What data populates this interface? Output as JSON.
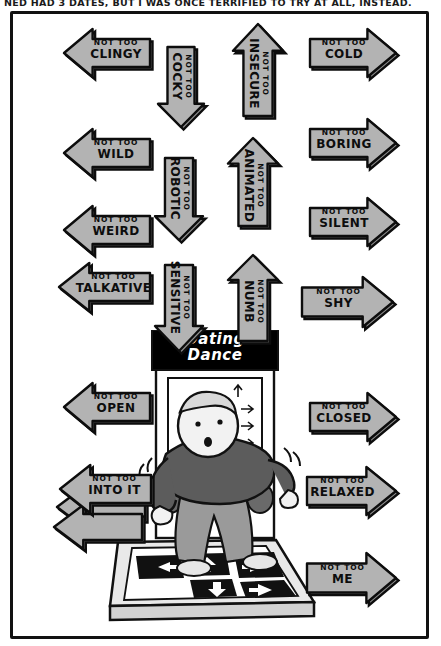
{
  "comic": {
    "caption": "NED HAD 3 DATES, BUT I WAS ONCE TERRIFIED TO TRY AT ALL, INSTEAD.",
    "panel_border_color": "#111111",
    "arrow_fill_color": "#b3b3b3",
    "arrow_shade_color": "#8f8f8f",
    "arrow_outline_color": "#0d0d0d",
    "background_color": "#ffffff"
  },
  "arcade": {
    "marquee_line1": "Dating",
    "marquee_line2": "Dance",
    "marquee_bg_color": "#000000",
    "marquee_text_color": "#ffffff",
    "screen_arrows": [
      "up-arrow",
      "right-arrow",
      "right-arrow",
      "right-arrow"
    ],
    "pad_arrows": [
      "left-arrow",
      "up-arrow",
      "down-arrow",
      "right-arrow"
    ],
    "dancer": {
      "sweater_color": "#5a5a5a",
      "jeans_color": "#8c8c8c",
      "skin_color": "#f2f2f2"
    }
  },
  "arrows": [
    {
      "id": "clingy",
      "prefix": "NOT TOO",
      "word": "CLINGY",
      "direction": "left",
      "x": 62,
      "y": 26,
      "w": 90,
      "h": 54
    },
    {
      "id": "cocky",
      "prefix": "NOT TOO",
      "word": "COCKY",
      "direction": "down",
      "x": 155,
      "y": 45,
      "w": 52,
      "h": 84
    },
    {
      "id": "insecure",
      "prefix": "NOT TOO",
      "word": "INSECURE",
      "direction": "up",
      "x": 230,
      "y": 22,
      "w": 56,
      "h": 96
    },
    {
      "id": "cold",
      "prefix": "NOT TOO",
      "word": "COLD",
      "direction": "right",
      "x": 308,
      "y": 26,
      "w": 90,
      "h": 54
    },
    {
      "id": "wild",
      "prefix": "NOT TOO",
      "word": "WILD",
      "direction": "left",
      "x": 62,
      "y": 126,
      "w": 90,
      "h": 54
    },
    {
      "id": "robotic",
      "prefix": "NOT TOO",
      "word": "ROBOTIC",
      "direction": "down",
      "x": 152,
      "y": 156,
      "w": 54,
      "h": 86
    },
    {
      "id": "animated",
      "prefix": "NOT TOO",
      "word": "ANIMATED",
      "direction": "up",
      "x": 225,
      "y": 136,
      "w": 56,
      "h": 92
    },
    {
      "id": "boring",
      "prefix": "NOT TOO",
      "word": "BORING",
      "direction": "right",
      "x": 308,
      "y": 116,
      "w": 90,
      "h": 54
    },
    {
      "id": "weird",
      "prefix": "NOT TOO",
      "word": "WEIRD",
      "direction": "left",
      "x": 62,
      "y": 203,
      "w": 90,
      "h": 54
    },
    {
      "id": "silent",
      "prefix": "NOT TOO",
      "word": "SILENT",
      "direction": "right",
      "x": 308,
      "y": 195,
      "w": 90,
      "h": 54
    },
    {
      "id": "talkative",
      "prefix": "NOT TOO",
      "word": "TALKATIVE",
      "direction": "left",
      "x": 57,
      "y": 260,
      "w": 95,
      "h": 54
    },
    {
      "id": "sensitive",
      "prefix": "NOT TOO",
      "word": "SENSITIVE",
      "direction": "down",
      "x": 152,
      "y": 263,
      "w": 54,
      "h": 90
    },
    {
      "id": "numb",
      "prefix": "NOT TOO",
      "word": "NUMB",
      "direction": "up",
      "x": 225,
      "y": 253,
      "w": 56,
      "h": 90
    },
    {
      "id": "shy",
      "prefix": "NOT TOO",
      "word": "SHY",
      "direction": "right",
      "x": 300,
      "y": 274,
      "w": 95,
      "h": 56
    },
    {
      "id": "open",
      "prefix": "NOT TOO",
      "word": "OPEN",
      "direction": "left",
      "x": 62,
      "y": 380,
      "w": 90,
      "h": 54
    },
    {
      "id": "closed",
      "prefix": "NOT TOO",
      "word": "CLOSED",
      "direction": "right",
      "x": 308,
      "y": 390,
      "w": 90,
      "h": 54
    },
    {
      "id": "into-it",
      "prefix": "NOT TOO",
      "word": "INTO IT",
      "direction": "left",
      "x": 58,
      "y": 462,
      "w": 95,
      "h": 54
    },
    {
      "id": "relaxed",
      "prefix": "NOT TOO",
      "word": "RELAXED",
      "direction": "right",
      "x": 305,
      "y": 464,
      "w": 93,
      "h": 54
    },
    {
      "id": "me",
      "prefix": "NOT TOO",
      "word": "ME",
      "direction": "right",
      "x": 305,
      "y": 550,
      "w": 93,
      "h": 56
    }
  ],
  "stacked_blank_arrows": [
    {
      "id": "into-it-echo-1",
      "direction": "left",
      "x": 55,
      "y": 482,
      "w": 92,
      "h": 50
    },
    {
      "id": "into-it-echo-2",
      "direction": "left",
      "x": 52,
      "y": 502,
      "w": 92,
      "h": 50
    }
  ]
}
